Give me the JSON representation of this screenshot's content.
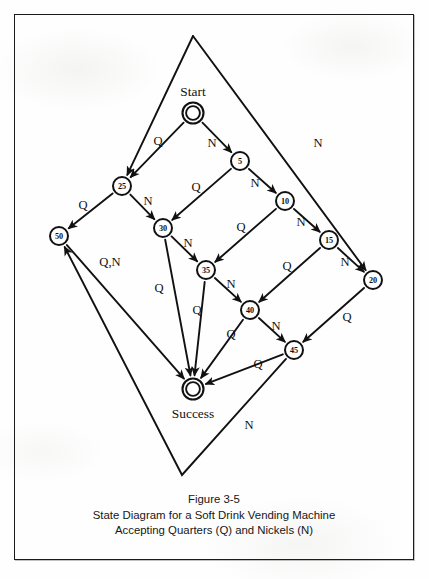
{
  "figure": {
    "caption_line1": "Figure 3-5",
    "caption_line2": "State Diagram for a Soft Drink Vending Machine",
    "caption_line3": "Accepting Quarters (Q) and Nickels (N)",
    "border_color": "#1b1b1b",
    "ink_color": "#111111",
    "paper_color": "#fdfdfd"
  },
  "chart_data": {
    "type": "diagram",
    "diagram_kind": "state-transition-diagram",
    "title": "State Diagram for a Soft Drink Vending Machine",
    "subtitle": "Accepting Quarters (Q) and Nickels (N)",
    "alphabet": [
      "Q",
      "N"
    ],
    "alphabet_meaning": {
      "Q": "Quarter (25 cents)",
      "N": "Nickel (5 cents)"
    },
    "start_state": "Start",
    "accept_state": "Success",
    "nodes": [
      {
        "id": "Start",
        "label": "Start",
        "display": "",
        "x": 193,
        "y": 113,
        "r": 10.5,
        "double": true,
        "name_label_dx": 0,
        "name_label_dy": -22
      },
      {
        "id": "5",
        "label": "",
        "display": "5",
        "x": 240,
        "y": 161,
        "r": 9.0,
        "double": false
      },
      {
        "id": "10",
        "label": "",
        "display": "10",
        "x": 285,
        "y": 201,
        "r": 9.0,
        "double": false
      },
      {
        "id": "15",
        "label": "",
        "display": "15",
        "x": 329,
        "y": 240,
        "r": 9.0,
        "double": false
      },
      {
        "id": "20",
        "label": "",
        "display": "20",
        "x": 373,
        "y": 280,
        "r": 9.0,
        "double": false
      },
      {
        "id": "25",
        "label": "",
        "display": "25",
        "x": 122,
        "y": 186,
        "r": 9.0,
        "double": false
      },
      {
        "id": "30",
        "label": "",
        "display": "30",
        "x": 163,
        "y": 228,
        "r": 9.0,
        "double": false
      },
      {
        "id": "35",
        "label": "",
        "display": "35",
        "x": 206,
        "y": 270,
        "r": 9.0,
        "double": false
      },
      {
        "id": "40",
        "label": "",
        "display": "40",
        "x": 250,
        "y": 310,
        "r": 9.0,
        "double": false
      },
      {
        "id": "45",
        "label": "",
        "display": "45",
        "x": 294,
        "y": 350,
        "r": 9.0,
        "double": false
      },
      {
        "id": "50",
        "label": "",
        "display": "50",
        "x": 59,
        "y": 236,
        "r": 9.0,
        "double": false
      },
      {
        "id": "Success",
        "label": "Success",
        "display": "",
        "x": 193,
        "y": 389,
        "r": 10.5,
        "double": true,
        "name_label_dx": 0,
        "name_label_dy": 24
      }
    ],
    "edges": [
      {
        "from": "Start",
        "to": "25",
        "label": "Q",
        "lx": 158,
        "ly": 141
      },
      {
        "from": "Start",
        "to": "5",
        "label": "N",
        "lx": 212,
        "ly": 143
      },
      {
        "from": "5",
        "to": "30",
        "label": "Q",
        "lx": 196,
        "ly": 187
      },
      {
        "from": "5",
        "to": "10",
        "label": "N",
        "lx": 255,
        "ly": 183
      },
      {
        "from": "10",
        "to": "35",
        "label": "Q",
        "lx": 241,
        "ly": 227
      },
      {
        "from": "10",
        "to": "15",
        "label": "N",
        "lx": 301,
        "ly": 222
      },
      {
        "from": "15",
        "to": "40",
        "label": "Q",
        "lx": 287,
        "ly": 266
      },
      {
        "from": "15",
        "to": "20",
        "label": "N",
        "lx": 345,
        "ly": 262
      },
      {
        "from": "25",
        "to": "50",
        "label": "Q",
        "lx": 83,
        "ly": 205
      },
      {
        "from": "25",
        "to": "30",
        "label": "N",
        "lx": 148,
        "ly": 201
      },
      {
        "from": "30",
        "to": "Success",
        "label": "Q",
        "lx": 159,
        "ly": 288
      },
      {
        "from": "30",
        "to": "35",
        "label": "N",
        "lx": 188,
        "ly": 243
      },
      {
        "from": "35",
        "to": "Success",
        "label": "Q",
        "lx": 197,
        "ly": 310
      },
      {
        "from": "35",
        "to": "40",
        "label": "N",
        "lx": 231,
        "ly": 284
      },
      {
        "from": "40",
        "to": "Success",
        "label": "Q",
        "lx": 231,
        "ly": 334
      },
      {
        "from": "40",
        "to": "45",
        "label": "N",
        "lx": 276,
        "ly": 326
      },
      {
        "from": "45",
        "to": "Success",
        "label": "Q",
        "lx": 258,
        "ly": 364
      },
      {
        "from": "20",
        "to": "45",
        "label": "Q",
        "lx": 347,
        "ly": 317
      },
      {
        "from": "50",
        "to": "Success",
        "label": "Q,N",
        "lx": 110,
        "ly": 262
      },
      {
        "from": "45",
        "to": "50",
        "label": "N",
        "lx": 249,
        "ly": 425,
        "via": [
          182,
          475
        ]
      },
      {
        "from": "Apex",
        "to": "25",
        "label": "",
        "lx": 0,
        "ly": 0
      },
      {
        "from": "Apex",
        "to": "20",
        "label": "N",
        "lx": 318,
        "ly": 143
      }
    ],
    "outer_apex_top": {
      "x": 193,
      "y": 36
    },
    "outer_apex_bottom": {
      "x": 182,
      "y": 475
    }
  }
}
